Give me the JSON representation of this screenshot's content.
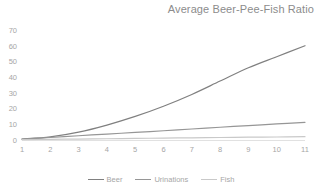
{
  "chart": {
    "title": "Average Beer-Pee-Fish Ratio"
  },
  "chart_data": {
    "type": "line",
    "title": "Average Beer-Pee-Fish Ratio",
    "xlabel": "",
    "ylabel": "",
    "x": [
      1,
      2,
      3,
      4,
      5,
      6,
      7,
      8,
      9,
      10,
      11
    ],
    "xticklabels": [
      "1",
      "2",
      "3",
      "4",
      "5",
      "6",
      "7",
      "8",
      "9",
      "10",
      "11"
    ],
    "yticklabels": [
      "0",
      "10",
      "20",
      "30",
      "40",
      "50",
      "60",
      "70"
    ],
    "yticks": [
      0,
      10,
      20,
      30,
      40,
      50,
      60,
      70
    ],
    "ylim": [
      0,
      70
    ],
    "xlim": [
      1,
      11
    ],
    "grid": false,
    "legend_position": "bottom",
    "series": [
      {
        "name": "Beer",
        "color": "#808080",
        "values": [
          0.6,
          2.0,
          5.0,
          9.5,
          15.0,
          21.5,
          29.0,
          37.5,
          46.0,
          53.0,
          60.0
        ]
      },
      {
        "name": "Urinations",
        "color": "#969696",
        "values": [
          0.5,
          1.6,
          2.7,
          3.8,
          4.8,
          5.9,
          7.0,
          8.1,
          9.2,
          10.2,
          11.2
        ]
      },
      {
        "name": "Fish",
        "color": "#c9c9c9",
        "values": [
          0.2,
          0.4,
          0.6,
          0.8,
          1.0,
          1.2,
          1.4,
          1.6,
          1.8,
          1.9,
          2.1
        ]
      }
    ]
  },
  "legend": {
    "items": [
      {
        "label": "Beer",
        "color": "#808080"
      },
      {
        "label": "Urinations",
        "color": "#969696"
      },
      {
        "label": "Fish",
        "color": "#c9c9c9"
      }
    ]
  }
}
